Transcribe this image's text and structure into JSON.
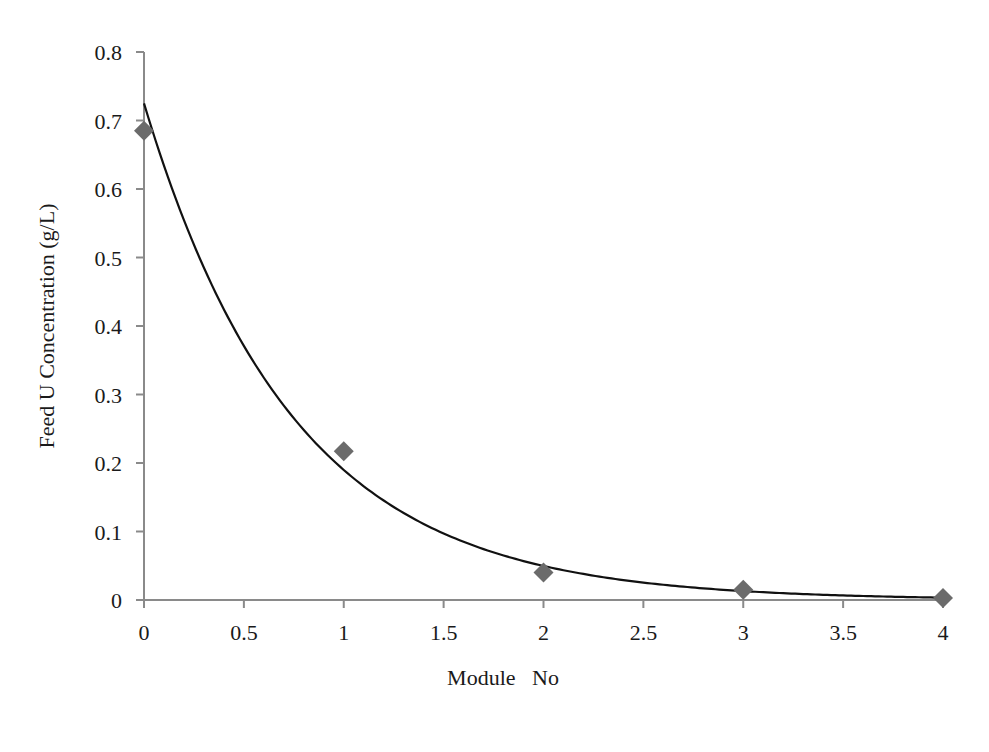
{
  "chart_data": {
    "type": "scatter",
    "title": "",
    "xlabel": "Module   No",
    "ylabel": "Feed U Concentration (g/L)",
    "xlim": [
      0,
      4
    ],
    "ylim": [
      0,
      0.8
    ],
    "x_ticks": [
      "0",
      "0.5",
      "1",
      "1.5",
      "2",
      "2.5",
      "3",
      "3.5",
      "4"
    ],
    "y_ticks": [
      "0",
      "0.1",
      "0.2",
      "0.3",
      "0.4",
      "0.5",
      "0.6",
      "0.7",
      "0.8"
    ],
    "grid": false,
    "legend": null,
    "series": [
      {
        "name": "Measured",
        "marker": "diamond",
        "color": "#6b6b6b",
        "x": [
          0,
          1,
          2,
          3,
          4
        ],
        "y": [
          0.685,
          0.217,
          0.04,
          0.015,
          0.003
        ]
      },
      {
        "name": "Exponential fit",
        "type": "line",
        "color": "#111111",
        "equation": "y = 0.725 * exp(-1.34 * x)",
        "a": 0.725,
        "k": 1.34
      }
    ]
  },
  "colors": {
    "axis": "#8a8a8a",
    "marker": "#6b6b6b",
    "curve": "#111111",
    "text": "#1a1a1a"
  }
}
